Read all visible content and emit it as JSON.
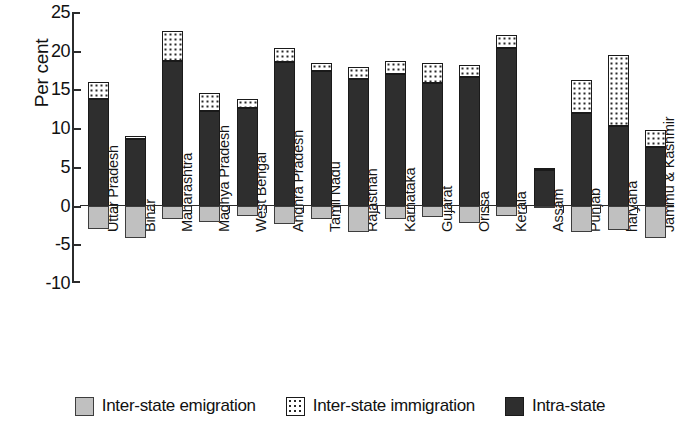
{
  "chart_data": {
    "type": "bar",
    "subtype": "stacked-diverging",
    "title": "",
    "xlabel": "",
    "ylabel": "Per cent",
    "ylim": [
      -10,
      25
    ],
    "yticks": [
      25,
      20,
      15,
      10,
      5,
      0,
      -5,
      -10
    ],
    "ytick_labels": [
      "25",
      "20",
      "15",
      "10",
      "5",
      "0",
      "-5",
      "-10"
    ],
    "grid": false,
    "legend_position": "bottom",
    "categories": [
      "Uttar Pradesh",
      "Bihar",
      "Maharashtra",
      "Madhya Pradesh",
      "West Bengal",
      "Andhra Pradesh",
      "Tamil Nadu",
      "Rajasthan",
      "Karnataka",
      "Gujarat",
      "Orissa",
      "Kerala",
      "Assam",
      "Punjab",
      "haryana",
      "Jammu & Kashmir"
    ],
    "series": [
      {
        "name": "Intra-state",
        "key": "intra",
        "color": "#2e2e2e",
        "pattern": "solid-dark",
        "values": [
          13.8,
          8.6,
          18.7,
          12.2,
          12.6,
          18.6,
          17.4,
          16.4,
          17.0,
          15.8,
          16.6,
          20.3,
          4.6,
          11.9,
          10.3,
          7.6
        ]
      },
      {
        "name": "Inter-state immigration",
        "key": "immigration",
        "color": "#ffffff",
        "pattern": "dotted",
        "values": [
          2.2,
          0.4,
          3.9,
          2.4,
          1.2,
          1.7,
          1.0,
          1.5,
          1.7,
          2.6,
          1.6,
          1.7,
          0.3,
          4.3,
          9.2,
          2.1
        ]
      },
      {
        "name": "Inter-state emigration",
        "key": "emigration",
        "color": "#c0c0c0",
        "pattern": "solid-light",
        "values": [
          -3.0,
          -4.2,
          -1.7,
          -2.1,
          -1.3,
          -2.4,
          -1.7,
          -3.4,
          -1.8,
          -1.5,
          -2.2,
          -1.3,
          -0.1,
          -3.4,
          -3.2,
          -4.2
        ]
      }
    ],
    "bar_totals_positive": [
      16.0,
      9.0,
      22.6,
      14.6,
      13.8,
      20.3,
      18.4,
      17.9,
      18.7,
      18.4,
      18.2,
      22.0,
      4.9,
      16.2,
      19.5,
      9.7
    ]
  },
  "legend": {
    "items": [
      {
        "label": "Inter-state emigration",
        "swatch": "light-gray-square-icon"
      },
      {
        "label": "Inter-state immigration",
        "swatch": "dotted-square-icon"
      },
      {
        "label": "Intra-state",
        "swatch": "dark-square-icon"
      }
    ]
  }
}
